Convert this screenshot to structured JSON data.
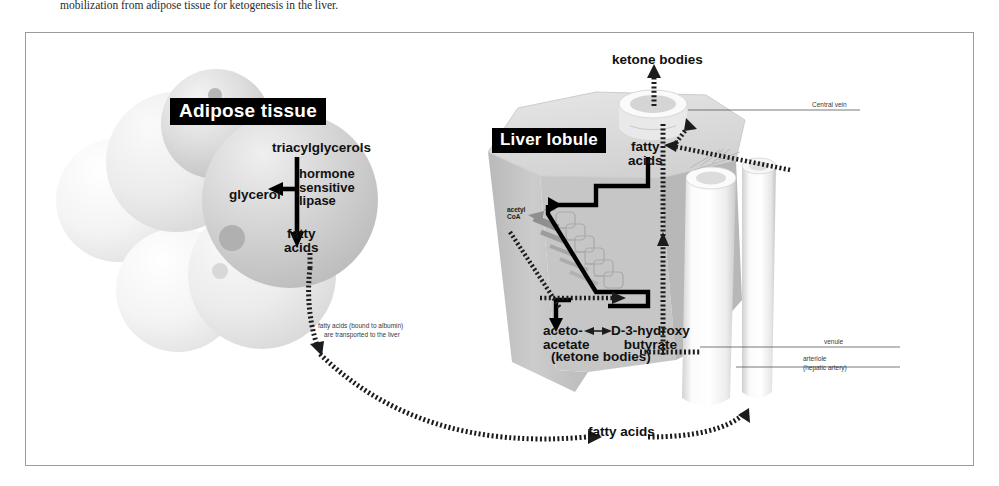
{
  "caption": {
    "left_text": "mobilization from adipose tissue for ketogenesis in the liver.",
    "right_text": "cleaved to diacylglycerol, then monoacylglycerol, which is needed"
  },
  "figure": {
    "banners": {
      "adipose": "Adipose tissue",
      "liver": "Liver lobule"
    },
    "adipose_section": {
      "triacylglycerols": "triacylglycerols",
      "glycerol": "glycerol",
      "hormone_sensitive_lipase": "hormone\nsensitive\nlipase",
      "hsl_line1": "hormone",
      "hsl_line2": "sensitive",
      "hsl_line3": "lipase",
      "fatty_acids": "fatty\nacids",
      "fatty_acids_line1": "fatty",
      "fatty_acids_line2": "acids"
    },
    "transport_note": {
      "line1": "fatty acids (bound to albumin)",
      "line2": "are transported to the liver"
    },
    "liver_section": {
      "ketone_bodies_out": "ketone bodies",
      "fatty_acids_line1": "fatty",
      "fatty_acids_line2": "acids",
      "acetyl_coa_line1": "acetyl",
      "acetyl_coa_line2": "CoA",
      "acetoacetate_line1": "aceto-",
      "acetoacetate_line2": "acetate",
      "d3_hydroxybutyrate_line1": "D-3-hydroxy",
      "d3_hydroxybutyrate_line2": "butyrate",
      "ketone_bodies_paren": "(ketone bodies)",
      "fatty_acids_bottom": "fatty acids"
    },
    "vessel_labels": {
      "central_vein": "Central vein",
      "venule": "venule",
      "arteriole_line1": "arteriole",
      "arteriole_line2": "(hepatic artery)"
    },
    "colors": {
      "banner_bg": "#000000",
      "banner_text": "#ffffff",
      "frame_border": "#9b9b9b",
      "lobule_top": "#dcdcdc",
      "lobule_side_light": "#cfcfcf",
      "lobule_side_dark": "#b4b4b4",
      "vessel": "#f2f2f2",
      "adipose_cell": "#c8c8c8",
      "arrow_black": "#000000",
      "arrow_gray": "#9a9a9a"
    }
  }
}
